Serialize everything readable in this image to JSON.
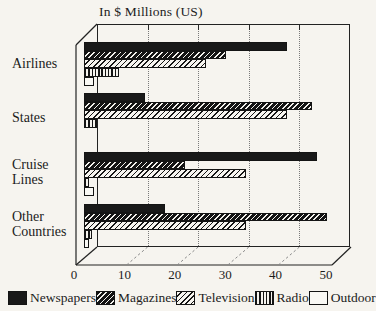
{
  "chart_data": {
    "type": "bar",
    "orientation": "horizontal",
    "style": "pseudo-3d-horizontal-grouped-bars",
    "title": "In $ Millions (US)",
    "categories": [
      "Airlines",
      "States",
      "Cruise Lines",
      "Other Countries"
    ],
    "series": [
      {
        "name": "Newspapers",
        "pattern": "solid-black",
        "values": [
          40,
          12,
          46,
          16
        ]
      },
      {
        "name": "Magazines",
        "pattern": "dark-diagonal-hatch",
        "values": [
          28,
          45,
          20,
          48
        ]
      },
      {
        "name": "Television",
        "pattern": "light-diagonal-hatch",
        "values": [
          24,
          40,
          32,
          32
        ]
      },
      {
        "name": "Radio",
        "pattern": "vertical-stripes",
        "values": [
          7,
          2.5,
          1,
          1.5
        ]
      },
      {
        "name": "Outdoor",
        "pattern": "white-empty",
        "values": [
          2,
          0,
          2,
          1
        ]
      }
    ],
    "xlim": [
      0,
      50
    ],
    "x_ticks": [
      "0",
      "10",
      "20",
      "30",
      "40",
      "50"
    ],
    "grid": "dotted-vertical-on-back-wall",
    "legend_position": "bottom"
  },
  "legend": {
    "items": [
      {
        "label": "Newspapers",
        "pattern": "solid-black"
      },
      {
        "label": "Magazines",
        "pattern": "dark-diagonal-hatch"
      },
      {
        "label": "Television",
        "pattern": "light-diagonal-hatch"
      },
      {
        "label": "Radio",
        "pattern": "vertical-stripes"
      },
      {
        "label": "Outdoor",
        "pattern": "white-empty"
      }
    ]
  },
  "colors": {
    "ink": "#1c1c1c",
    "paper": "#f6f4ef",
    "gridline": "#7a7a7a"
  }
}
